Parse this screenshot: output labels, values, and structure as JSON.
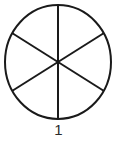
{
  "figure": {
    "caption": "1",
    "background_color": "#ffffff",
    "stroke_color": "#1a1a1a",
    "fill_color": "#ffffff",
    "stroke_width": 2,
    "circle": {
      "center_x": 58,
      "center_y": 62,
      "radius_x": 53,
      "radius_y": 57
    },
    "sector_count": 6,
    "sector_angle_degrees": 60,
    "divider_lines": [
      {
        "name": "vertical-diameter",
        "angle_degrees": 90,
        "x1": 58,
        "y1": 5,
        "x2": 58,
        "y2": 119
      },
      {
        "name": "diagonal-diameter-up-right",
        "angle_degrees": 30,
        "x1": 12,
        "y1": 33,
        "x2": 104,
        "y2": 91
      },
      {
        "name": "diagonal-diameter-down-right",
        "angle_degrees": 150,
        "x1": 12,
        "y1": 91,
        "x2": 104,
        "y2": 33
      }
    ]
  },
  "chart_data": {
    "type": "pie",
    "title": "1",
    "categories": [
      "1",
      "2",
      "3",
      "4",
      "5",
      "6"
    ],
    "values": [
      1,
      1,
      1,
      1,
      1,
      1
    ],
    "slice_percent": 16.67,
    "total_slices": 6,
    "shaded_slices": 0,
    "legend": [],
    "xlabel": "",
    "ylabel": ""
  }
}
